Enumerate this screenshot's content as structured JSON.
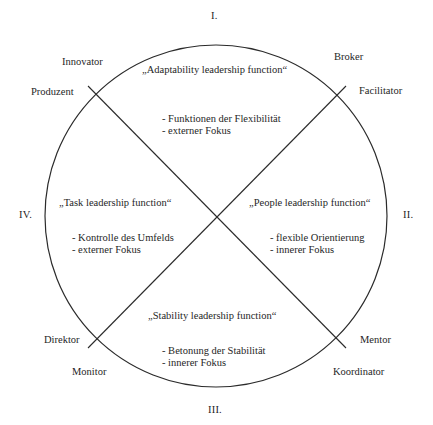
{
  "diagram": {
    "type": "competing-values-framework",
    "shape": "circle-with-two-diagonals",
    "geometry": {
      "center_x": 216,
      "center_y": 216,
      "radius": 171
    },
    "quadrant_numerals": {
      "top": "I.",
      "right": "II.",
      "bottom": "III.",
      "left": "IV."
    },
    "roles": {
      "innovator": "Innovator",
      "produzent": "Produzent",
      "broker": "Broker",
      "facilitator": "Facilitator",
      "direktor": "Direktor",
      "monitor": "Monitor",
      "mentor": "Mentor",
      "koordinator": "Koordinator"
    },
    "quadrants": {
      "top": {
        "title": "„Adaptability leadership function“",
        "bullets": [
          "- Funktionen der Flexibilität",
          "- externer Fokus"
        ]
      },
      "left": {
        "title": "„Task leadership function“",
        "bullets": [
          "- Kontrolle des Umfelds",
          "- externer Fokus"
        ]
      },
      "right": {
        "title": "„People leadership function“",
        "bullets": [
          "- flexible Orientierung",
          "- innerer Fokus"
        ]
      },
      "bottom": {
        "title": "„Stability leadership function“",
        "bullets": [
          "- Betonung der Stabilität",
          "- innerer Fokus"
        ]
      }
    },
    "colors": {
      "background": "#ffffff",
      "stroke": "#2b2b2b",
      "text": "#262626"
    }
  }
}
